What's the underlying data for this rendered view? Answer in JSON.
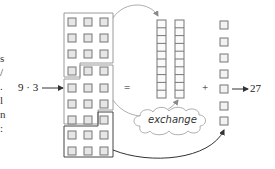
{
  "left_edge_fragments": [
    "s",
    "/",
    ".",
    "l",
    "n",
    ":"
  ],
  "expression": {
    "left": "9 · 3",
    "equals": "=",
    "plus": "+",
    "result": "27"
  },
  "cloud_label": "exchange",
  "grid": {
    "rows": 9,
    "cols": 3,
    "groups": [
      10,
      10,
      7
    ]
  },
  "tens_rods": {
    "count": 2,
    "cells_each": 10
  },
  "ones": {
    "count": 7
  },
  "colors": {
    "stroke": "#777777",
    "fill": "#e6e6e6",
    "outline_light": "#9a9a9a",
    "outline_dark": "#444444",
    "arrow": "#333333"
  }
}
